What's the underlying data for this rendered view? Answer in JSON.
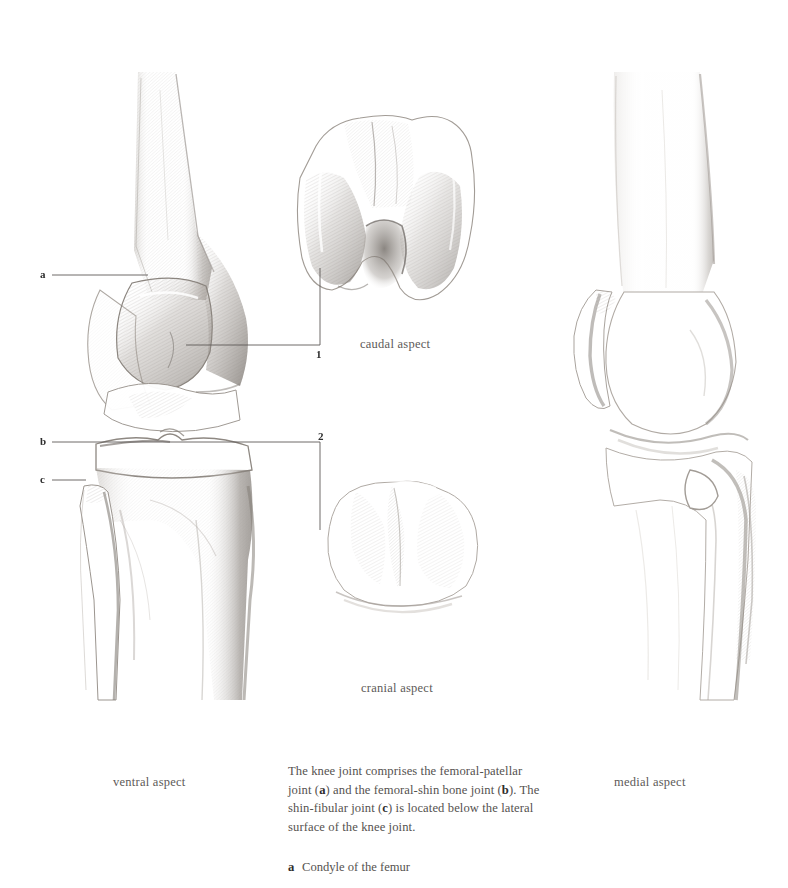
{
  "page": {
    "width": 788,
    "height": 888,
    "background": "#ffffff",
    "ink": "#6b6663",
    "label_color": "#2d2d2d",
    "caption_color": "#5d5a58"
  },
  "figures": [
    {
      "id": "ventral",
      "name": "ventral-knee-figure",
      "caption": "ventral aspect",
      "caption_x": 113,
      "caption_y": 775
    },
    {
      "id": "caudal",
      "name": "caudal-femur-figure",
      "caption": "caudal aspect",
      "caption_x": 360,
      "caption_y": 337
    },
    {
      "id": "cranial",
      "name": "cranial-tibia-figure",
      "caption": "cranial aspect",
      "caption_x": 361,
      "caption_y": 681
    },
    {
      "id": "medial",
      "name": "medial-knee-figure",
      "caption": "medial aspect",
      "caption_x": 614,
      "caption_y": 775
    }
  ],
  "leader_labels": [
    {
      "key": "a",
      "x": 40,
      "y": 269
    },
    {
      "key": "b",
      "x": 40,
      "y": 436
    },
    {
      "key": "c",
      "x": 40,
      "y": 474
    },
    {
      "key": "1",
      "x": 316,
      "y": 349
    },
    {
      "key": "2",
      "x": 318,
      "y": 431
    }
  ],
  "description": {
    "segments": [
      {
        "text": "The knee joint comprises the femoral-patellar joint (",
        "bold": false
      },
      {
        "text": "a",
        "bold": true
      },
      {
        "text": ") and the femoral-shin bone joint (",
        "bold": false
      },
      {
        "text": "b",
        "bold": true
      },
      {
        "text": "). The shin-fibular joint (",
        "bold": false
      },
      {
        "text": "c",
        "bold": true
      },
      {
        "text": ") is located below the lateral surface of the knee joint.",
        "bold": false
      }
    ],
    "plain": "The knee joint comprises the femoral-patellar joint (a) and the femoral-shin bone joint (b). The shin-fibular joint (c) is located below the lateral surface of the knee joint."
  },
  "legend": [
    {
      "key": "a",
      "label": "Condyle of the femur"
    }
  ]
}
